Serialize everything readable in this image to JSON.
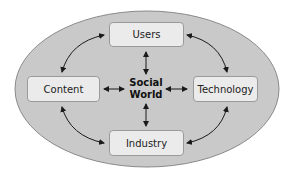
{
  "diagram": {
    "center": {
      "line1": "Social",
      "line2": "World"
    },
    "nodes": {
      "top": "Users",
      "left": "Content",
      "right": "Technology",
      "bottom": "Industry"
    },
    "colors": {
      "ellipse_fill": "#c9c9c9",
      "ellipse_stroke": "#8a8a8a",
      "box_fill": "#ebebeb",
      "arrow": "#1a1a1a"
    }
  }
}
